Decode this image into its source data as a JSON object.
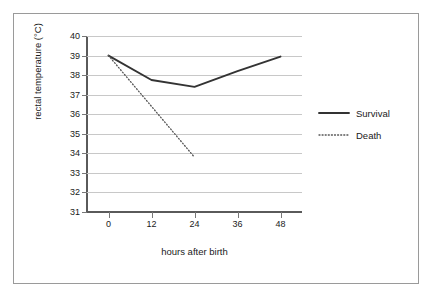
{
  "chart_data": {
    "type": "line",
    "title": "",
    "xlabel": "hours after birth",
    "ylabel": "rectal temperature (°C)",
    "xlim": [
      -6,
      54
    ],
    "ylim": [
      31,
      40
    ],
    "xticks": [
      0,
      12,
      24,
      36,
      48
    ],
    "xtick_labels": [
      "0",
      "12",
      "24",
      "36",
      "48"
    ],
    "yticks": [
      31,
      32,
      33,
      34,
      35,
      36,
      37,
      38,
      39,
      40
    ],
    "ytick_labels": [
      "31",
      "32",
      "33",
      "34",
      "35",
      "36",
      "37",
      "38",
      "39",
      "40"
    ],
    "grid": true,
    "grid_axis": "y",
    "legend_position": "right",
    "series": [
      {
        "name": "Survival",
        "style": "solid",
        "color": "#333333",
        "x": [
          0,
          12,
          24,
          36,
          48
        ],
        "y": [
          39.0,
          37.75,
          37.4,
          38.2,
          38.95
        ]
      },
      {
        "name": "Death",
        "style": "dotted",
        "color": "#555555",
        "x": [
          0,
          24
        ],
        "y": [
          39.0,
          33.8
        ]
      }
    ]
  },
  "legend": {
    "entries": [
      {
        "label": "Survival",
        "style": "solid"
      },
      {
        "label": "Death",
        "style": "dotted"
      }
    ]
  },
  "colors": {
    "frame_border": "#9a9a9a",
    "gridline": "#c8c8c8",
    "axis": "#5a5a5a",
    "text": "#1a1a1a",
    "background": "#ffffff"
  }
}
